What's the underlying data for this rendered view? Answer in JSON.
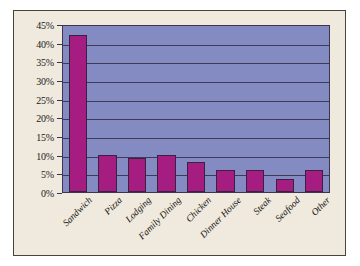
{
  "chart_data": {
    "type": "bar",
    "title": "",
    "subtitle": "",
    "xlabel": "",
    "ylabel": "",
    "categories": [
      "Sandwich",
      "Pizza",
      "Lodging",
      "Family Dining",
      "Chicken",
      "Dinner House",
      "Steak",
      "Seafood",
      "Other"
    ],
    "values": [
      42,
      10,
      9,
      10,
      8,
      6,
      6,
      3.5,
      6
    ],
    "value_suffix": "%",
    "ylim": [
      0,
      45
    ],
    "ytick_labels": [
      "0%",
      "5%",
      "10%",
      "15%",
      "20%",
      "25%",
      "30%",
      "35%",
      "40%",
      "45%"
    ],
    "ytick_values": [
      0,
      5,
      10,
      15,
      20,
      25,
      30,
      35,
      40,
      45
    ],
    "grid": true,
    "grid_axis": "y",
    "legend": false,
    "legend_position": "none",
    "xtick_rotation": -45,
    "colors": {
      "bar_fill": "#a51d80",
      "bar_border": "#3b2042",
      "plot_background": "#838bc2",
      "plot_border": "#3b3550",
      "gridline": "#3f3a57",
      "canvas_background": "#efe9de",
      "canvas_border": "#4a4438",
      "text": "#1c1a18"
    }
  }
}
